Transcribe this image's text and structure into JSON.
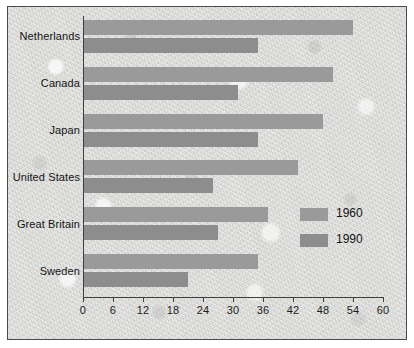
{
  "chart_data": {
    "type": "bar",
    "orientation": "horizontal",
    "title": "",
    "subtitle": "",
    "xlabel": "",
    "ylabel": "",
    "categories": [
      "Netherlands",
      "Canada",
      "Japan",
      "United States",
      "Great Britain",
      "Sweden"
    ],
    "series": [
      {
        "name": "1960",
        "color": "#9a9a9a",
        "values": [
          54,
          50,
          48,
          43,
          37,
          35
        ]
      },
      {
        "name": "1990",
        "color": "#8d8d8d",
        "values": [
          35,
          31,
          35,
          26,
          27,
          21
        ]
      }
    ],
    "xlim": [
      0,
      60
    ],
    "xticks": [
      0,
      6,
      12,
      18,
      24,
      30,
      36,
      42,
      48,
      54,
      60
    ],
    "xtick_labels": [
      "0",
      "6",
      "12",
      "18",
      "24",
      "30",
      "36",
      "42",
      "48",
      "54",
      "60"
    ],
    "grid": false,
    "legend": {
      "position": "inside-right",
      "entries": [
        "1960",
        "1990"
      ]
    },
    "annotations": []
  },
  "figure": {
    "background_color": "#d8d8d6",
    "border_color": "#4a4a4a",
    "axis_color": "#3e3e3e",
    "text_color": "#141414"
  }
}
